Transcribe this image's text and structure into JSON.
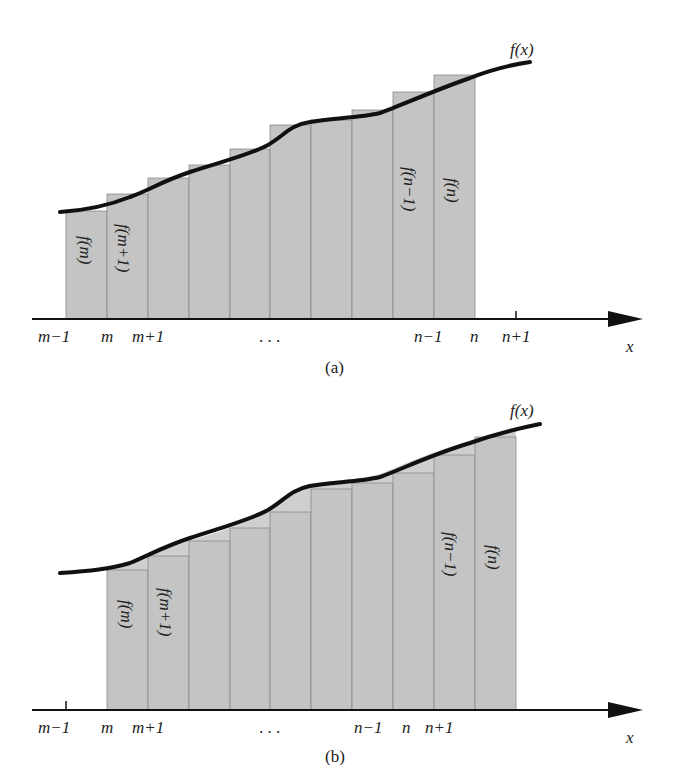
{
  "figure": {
    "colors": {
      "bar_fill": "#c4c4c4",
      "bar_edge": "#8a8a8a",
      "bar_top_outline": "#b0b0b0",
      "curve": "#111111",
      "axis": "#111111",
      "text": "#222222"
    },
    "curve_label": "f(x)",
    "axis_label": "x",
    "ellipsis": ". . .",
    "panels": [
      {
        "id": "a",
        "caption": "(a)",
        "tick_labels": [
          "m−1",
          "m",
          "m+1",
          "n−1",
          "n",
          "n+1"
        ],
        "bar_labels": [
          "f(m)",
          "f(m+1)",
          "f(n−1)",
          "f(n)"
        ],
        "description": "Rectangles from m-1 to n with heights f(m)...f(n); tops lie above the curve (right endpoints)"
      },
      {
        "id": "b",
        "caption": "(b)",
        "tick_labels": [
          "m−1",
          "m",
          "m+1",
          "n−1",
          "n",
          "n+1"
        ],
        "bar_labels": [
          "f(m)",
          "f(m+1)",
          "f(n−1)",
          "f(n)"
        ],
        "description": "Rectangles from m to n+1 with heights f(m)...f(n); tops lie below the curve (left endpoints)"
      }
    ]
  }
}
